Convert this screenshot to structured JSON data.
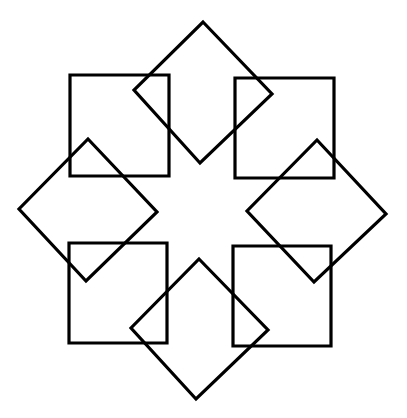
{
  "diagram": {
    "stroke_color": "#000000",
    "background": "#ffffff",
    "squares": [
      {
        "name": "square-top-left",
        "points": "70,75 169,75 169,176 70,176"
      },
      {
        "name": "square-top-right",
        "points": "235,78 334,78 334,178 235,178"
      },
      {
        "name": "square-bottom-left",
        "points": "69,243 167,243 167,343 69,343"
      },
      {
        "name": "square-bottom-right",
        "points": "233,246 331,246 331,346 233,346"
      }
    ],
    "diamonds": [
      {
        "name": "diamond-top",
        "points": "203,22 272,94 200,163 134,90"
      },
      {
        "name": "diamond-right",
        "points": "317,140 386,214 314,282 247,211"
      },
      {
        "name": "diamond-bottom",
        "points": "199,259 268,330 196,399 131,328"
      },
      {
        "name": "diamond-left",
        "points": "88,139 157,212 86,281 19,209"
      }
    ]
  }
}
